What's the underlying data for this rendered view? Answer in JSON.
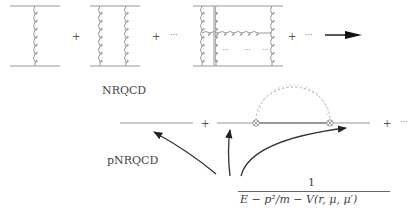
{
  "diagram": {
    "top_row": {
      "terms": [
        "single-gluon-exchange",
        "double-gluon-exchange",
        "crossed-ladder-exchange"
      ],
      "operators": [
        "+",
        "+",
        "⋯",
        "+",
        "⋯"
      ],
      "ellipsis_inside": [
        "⋯",
        "⋯",
        "⋯"
      ],
      "arrow": "right-arrow"
    },
    "labels": {
      "nrqcd": "NRQCD",
      "pnrqcd": "pNRQCD"
    },
    "bottom_row": {
      "operators": [
        "+",
        "+",
        "⋯"
      ]
    },
    "propagator": {
      "numerator": "1",
      "denominator": "E − p²/m − V(r, μ, μ′)"
    },
    "colors": {
      "line": "#888888",
      "arrow": "#333333",
      "text": "#444444"
    }
  }
}
